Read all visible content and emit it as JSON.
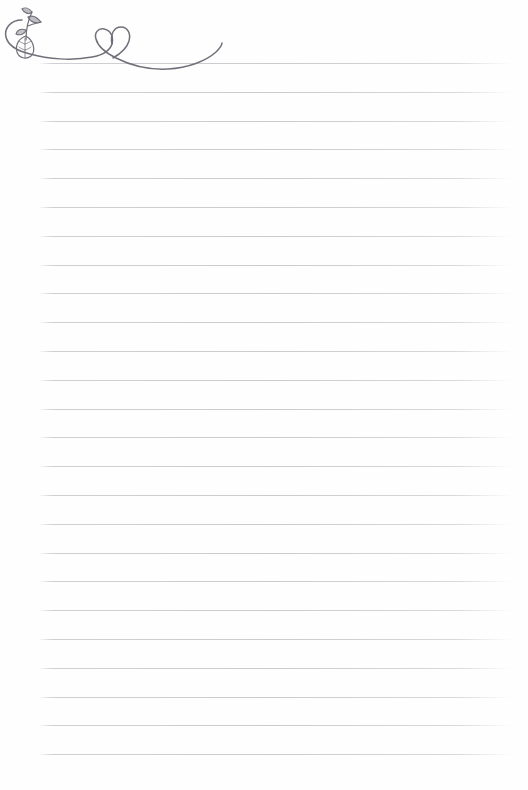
{
  "page": {
    "background_color": "#fefefe",
    "width": 528,
    "height": 790
  },
  "ruled_lines": {
    "count": 25,
    "first_line_y": 63,
    "spacing": 28.8,
    "start_x": 38,
    "end_x": 512,
    "color": "#cecece"
  },
  "decoration": {
    "name": "plant-heart-flourish",
    "description": "Hand-drawn swirl flourish with leafy sprig at left and a heart formed where the curve crosses itself",
    "color": "#6f6f75",
    "elements": {
      "swirl": "swirl-curve",
      "heart": "heart-shape",
      "sprig": "leaf-sprig"
    }
  },
  "footer": {
    "page_mark": ""
  },
  "content": {
    "written_text": ""
  }
}
